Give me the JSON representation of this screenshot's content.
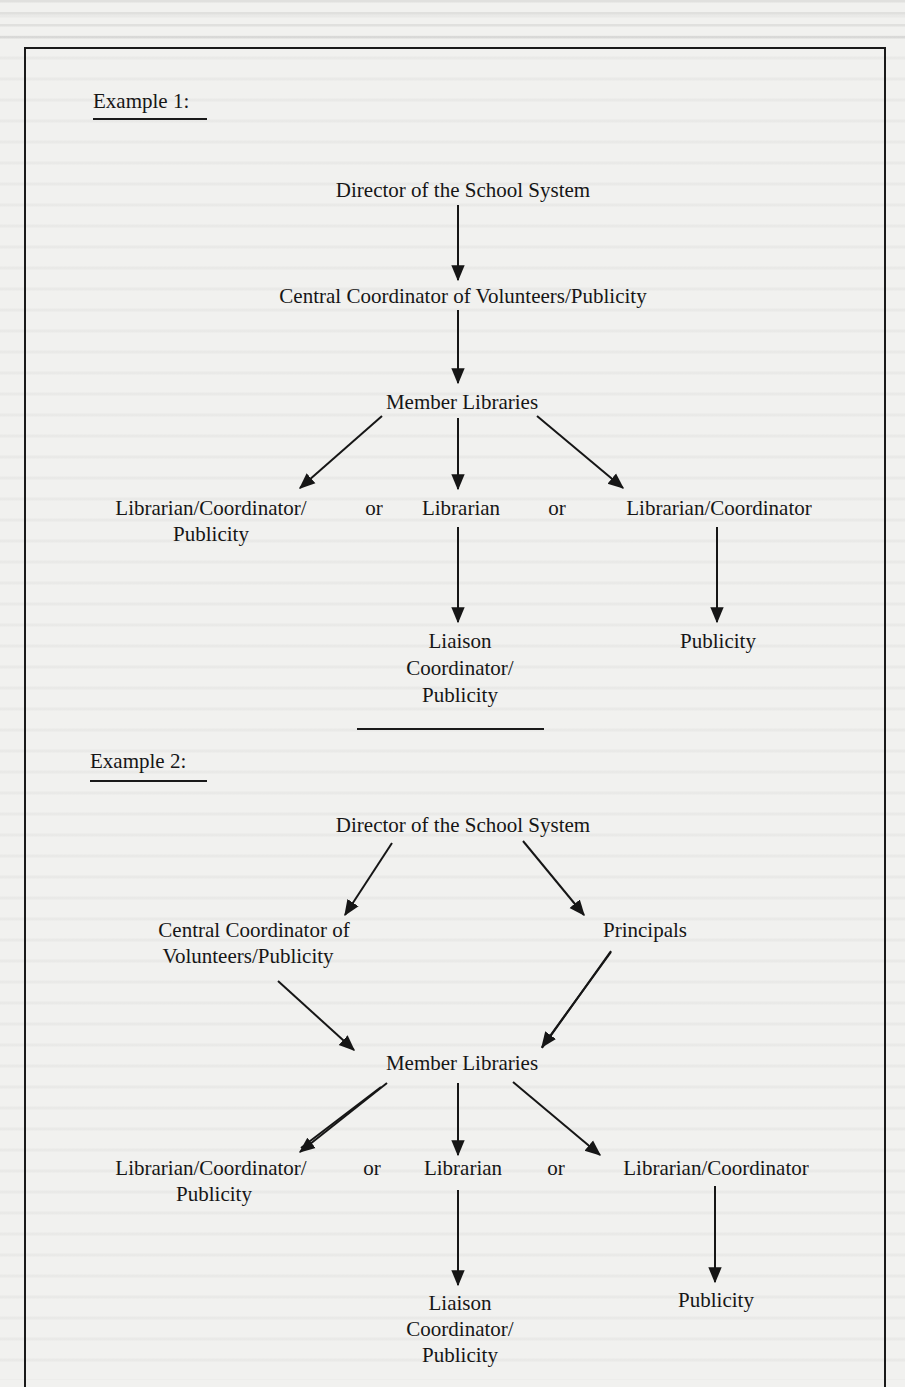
{
  "document": {
    "type": "scanned-book-page",
    "colors": {
      "paper": "#f1f1ef",
      "ink": "#161616"
    }
  },
  "example1": {
    "heading": "Example 1:",
    "nodes": {
      "director": "Director of the School System",
      "central": "Central Coordinator of Volunteers/Publicity",
      "member": "Member Libraries",
      "lib_coord_pub_line1": "Librarian/Coordinator/",
      "lib_coord_pub_line2": "Publicity",
      "or1": "or",
      "librarian": "Librarian",
      "or2": "or",
      "lib_coord": "Librarian/Coordinator",
      "liaison_line1": "Liaison",
      "liaison_line2": "Coordinator/",
      "liaison_line3": "Publicity",
      "publicity": "Publicity"
    },
    "edges": [
      [
        "Director of the School System",
        "Central Coordinator of Volunteers/Publicity"
      ],
      [
        "Central Coordinator of Volunteers/Publicity",
        "Member Libraries"
      ],
      [
        "Member Libraries",
        "Librarian/Coordinator/Publicity"
      ],
      [
        "Member Libraries",
        "Librarian"
      ],
      [
        "Member Libraries",
        "Librarian/Coordinator"
      ],
      [
        "Librarian",
        "Liaison Coordinator/Publicity"
      ],
      [
        "Librarian/Coordinator",
        "Publicity"
      ]
    ]
  },
  "example2": {
    "heading": "Example 2:",
    "nodes": {
      "director": "Director of the School System",
      "central_line1": "Central Coordinator of",
      "central_line2": "Volunteers/Publicity",
      "principals": "Principals",
      "member": "Member Libraries",
      "lib_coord_pub_line1": "Librarian/Coordinator/",
      "lib_coord_pub_line2": "Publicity",
      "or1": "or",
      "librarian": "Librarian",
      "or2": "or",
      "lib_coord": "Librarian/Coordinator",
      "liaison_line1": "Liaison",
      "liaison_line2": "Coordinator/",
      "liaison_line3": "Publicity",
      "publicity": "Publicity"
    },
    "edges": [
      [
        "Director of the School System",
        "Central Coordinator of Volunteers/Publicity"
      ],
      [
        "Director of the School System",
        "Principals"
      ],
      [
        "Central Coordinator of Volunteers/Publicity",
        "Member Libraries"
      ],
      [
        "Principals",
        "Member Libraries"
      ],
      [
        "Member Libraries",
        "Librarian/Coordinator/Publicity"
      ],
      [
        "Member Libraries",
        "Librarian"
      ],
      [
        "Member Libraries",
        "Librarian/Coordinator"
      ],
      [
        "Librarian",
        "Liaison Coordinator/Publicity"
      ],
      [
        "Librarian/Coordinator",
        "Publicity"
      ]
    ]
  }
}
